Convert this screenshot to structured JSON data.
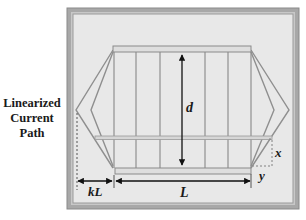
{
  "diagram": {
    "side_label": {
      "lines": [
        "Linearized",
        "Current",
        "Path"
      ]
    },
    "labels": {
      "d": "d",
      "L": "L",
      "kL": "kL",
      "x": "x",
      "y": "y"
    },
    "colors": {
      "frame_outer": "#9a9a9a",
      "frame_inner": "#8c8c8c",
      "panel_bg": "#e6e6e6",
      "bar_fill": "#dcdcdc",
      "bar_stroke": "#8a8a8a",
      "line": "#8f8f8f",
      "arrow": "#111111"
    },
    "structure": {
      "vertical_lines_count": 7,
      "has_top_bar": true,
      "has_bottom_bar": true,
      "has_horizontal_crossbar": true
    }
  }
}
